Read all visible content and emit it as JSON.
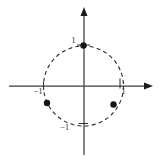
{
  "figure": {
    "background": "#ffffff",
    "axis_color": "#3d3d3d",
    "circle_color": "#2b2b2b",
    "tick_color": "#2f2f2f",
    "dot_color": "#141414",
    "label_color": "#3a3a3a",
    "font_size": 9,
    "canvas": {
      "width": 165,
      "height": 161
    },
    "axes": {
      "x_axis": {
        "x1": 9,
        "y1": 86,
        "x2": 152,
        "y2": 86,
        "arrow_end": "right"
      },
      "y_axis": {
        "x1": 84,
        "y1": 155,
        "x2": 84,
        "y2": 8,
        "arrow_end": "up"
      }
    },
    "circle": {
      "cx": 83.5,
      "cy": 86,
      "r": 40,
      "dash": "4 3.2",
      "stroke_width": 1.1
    },
    "ticks": [
      {
        "name": "tick-x-neg1",
        "x1": 43.5,
        "y1": 82,
        "x2": 43.5,
        "y2": 90
      },
      {
        "name": "tick-x-pos1",
        "x1": 120,
        "y1": 78.5,
        "x2": 120,
        "y2": 88.5
      },
      {
        "name": "tick-y-pos1",
        "x1": 77,
        "y1": 45,
        "x2": 90,
        "y2": 45
      },
      {
        "name": "tick-y-neg1",
        "x1": 78.5,
        "y1": 123.5,
        "x2": 88,
        "y2": 123.5
      }
    ],
    "points": [
      {
        "name": "point-top",
        "cx": 83.5,
        "cy": 45.5,
        "r": 3.2
      },
      {
        "name": "point-lower-left",
        "cx": 47,
        "cy": 103,
        "r": 3.2
      },
      {
        "name": "point-lower-right",
        "cx": 113.5,
        "cy": 104.5,
        "r": 3.2
      }
    ],
    "labels": [
      {
        "name": "label-y-pos1",
        "text": "1",
        "x": 73.5,
        "y": 43
      },
      {
        "name": "label-x-neg1",
        "text": "−1",
        "x": 38,
        "y": 94
      },
      {
        "name": "label-x-pos1",
        "text": "1",
        "x": 123.5,
        "y": 93.5
      },
      {
        "name": "label-y-neg1",
        "text": "−1",
        "x": 64.5,
        "y": 129.5
      }
    ]
  }
}
